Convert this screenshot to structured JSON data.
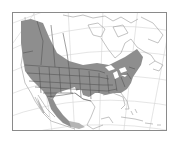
{
  "map": {
    "type": "species-range-map",
    "region": "North America",
    "colors": {
      "background": "#ffffff",
      "frame": "#8a8a8a",
      "graticule": "#d4d4d4",
      "coast": "#9a9a9a",
      "borders": "#505050",
      "range_fill": "#8e8e8e",
      "range_fill_light": "#b5b5b5"
    },
    "range_areas": [
      "western-canada",
      "central-and-eastern-usa",
      "western-mexico-coast"
    ]
  }
}
